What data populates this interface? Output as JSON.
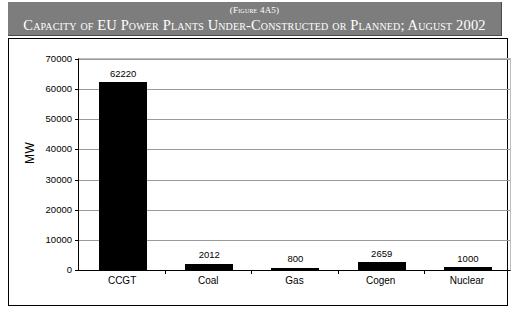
{
  "banner": {
    "subtitle": "(Figure 4A5)",
    "title": "Capacity of EU Power Plants Under-Constructed or Planned; August 2002",
    "background_color": "#7d7d7d",
    "text_color": "#ffffff"
  },
  "chart_data": {
    "type": "bar",
    "title": "Capacity of EU Power Plants Under-Constructed or Planned; August 2002",
    "subtitle": "(Figure 4A5)",
    "categories": [
      "CCGT",
      "Coal",
      "Gas",
      "Cogen",
      "Nuclear"
    ],
    "values": [
      62220,
      2012,
      800,
      2659,
      1000
    ],
    "value_labels": [
      "62220",
      "2012",
      "800",
      "2659",
      "1000"
    ],
    "xlabel": "",
    "ylabel": "MW",
    "ylim": [
      0,
      70000
    ],
    "ytick_values": [
      0,
      10000,
      20000,
      30000,
      40000,
      50000,
      60000,
      70000
    ],
    "ytick_labels": [
      "0",
      "10000",
      "20000",
      "30000",
      "40000",
      "50000",
      "60000",
      "70000"
    ],
    "grid": true,
    "grid_orientation": "horizontal",
    "legend": false,
    "bar_color": "#000000",
    "plot_background": "#ffffff",
    "gridline_color": "#9a9a9a"
  }
}
